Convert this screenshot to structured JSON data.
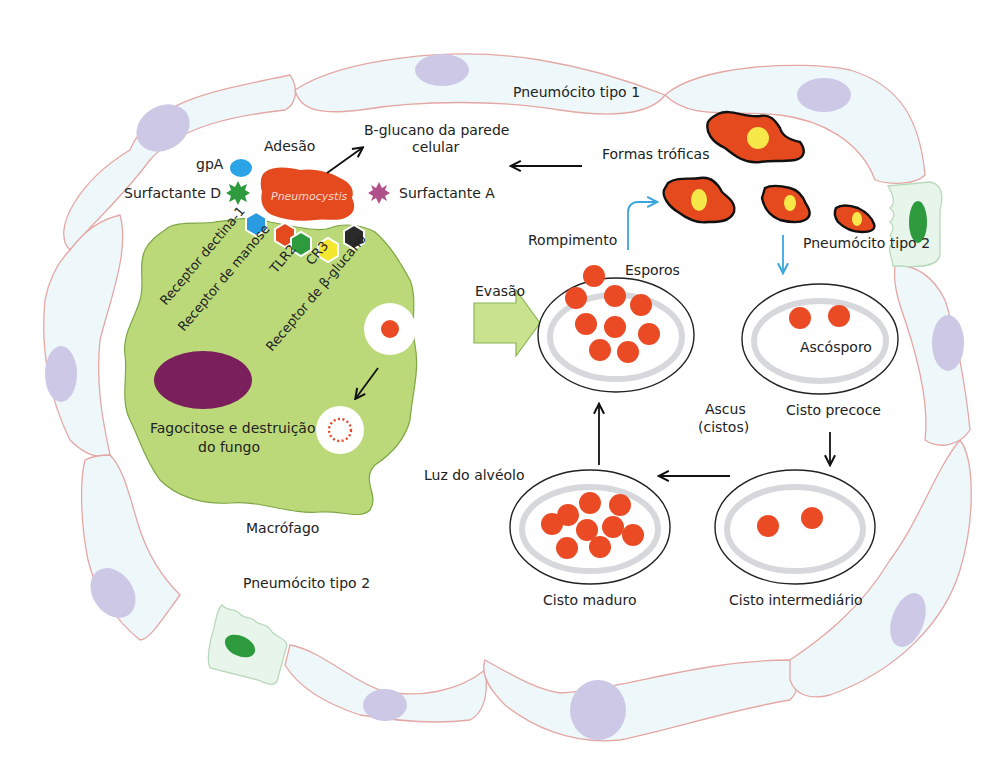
{
  "figure": {
    "colors": {
      "alveolar_cell_fill": "#eef8fb",
      "alveolar_cell_stroke": "#e4a7a4",
      "nucleus": "#cdc8e6",
      "macrophage": "#bcd97a",
      "macrophage_nucleus": "#7a1f5c",
      "pneumocystis": "#e44a1e",
      "spore": "#ea4b25",
      "trophic_nucleus": "#f7e84a",
      "type2_nucleus": "#2e9a3e",
      "blue_arrow": "#3aa6de"
    }
  },
  "labels": {
    "pneumocito_tipo1": "Pneumócito tipo 1",
    "pneumocito_tipo2_right": "Pneumócito tipo 2",
    "pneumocito_tipo2_bottom": "Pneumócito tipo 2",
    "adesao": "Adesão",
    "b_glucano_line1": "B-glucano da parede",
    "b_glucano_line2": "celular",
    "gpa": "gpA",
    "surfactante_d": "Surfactante D",
    "surfactante_a": "Surfactante A",
    "pneumocystis": "Pneumocystis",
    "formas_troficas": "Formas tróficas",
    "rompimento": "Rompimento",
    "esporos": "Esporos",
    "evasao": "Evasão",
    "ascosporo": "Ascósporo",
    "ascus_line1": "Ascus",
    "ascus_line2": "(cistos)",
    "cisto_precoce": "Cisto precoce",
    "cisto_intermediario": "Cisto intermediário",
    "cisto_maduro": "Cisto maduro",
    "luz_alveolo": "Luz do alvéolo",
    "fagocitose_line1": "Fagocitose e destruição",
    "fagocitose_line2": "do fungo",
    "macrofago": "Macrófago"
  },
  "receptors": [
    {
      "name": "Receptor dectina-1",
      "color": "#2a9be0"
    },
    {
      "name": "Receptor de manose",
      "color": "#e44a1e"
    },
    {
      "name": "TLR2",
      "color": "#2e9a3e"
    },
    {
      "name": "CR3",
      "color": "#f4e72e"
    },
    {
      "name": "Receptor de β-glucano",
      "color": "#2a2a2a"
    }
  ],
  "ligands": [
    {
      "name": "gpA",
      "shape": "ellipse",
      "color": "#2aa4e6"
    },
    {
      "name": "Surfactante D",
      "shape": "star",
      "color": "#2e9a3e"
    },
    {
      "name": "Surfactante A",
      "shape": "star",
      "color": "#b0508a"
    }
  ],
  "cysts": [
    {
      "stage": "Esporos",
      "spore_count": 10
    },
    {
      "stage": "Cisto precoce",
      "spore_count": 2
    },
    {
      "stage": "Cisto intermediário",
      "spore_count": 2
    },
    {
      "stage": "Cisto maduro",
      "spore_count": 9
    }
  ]
}
